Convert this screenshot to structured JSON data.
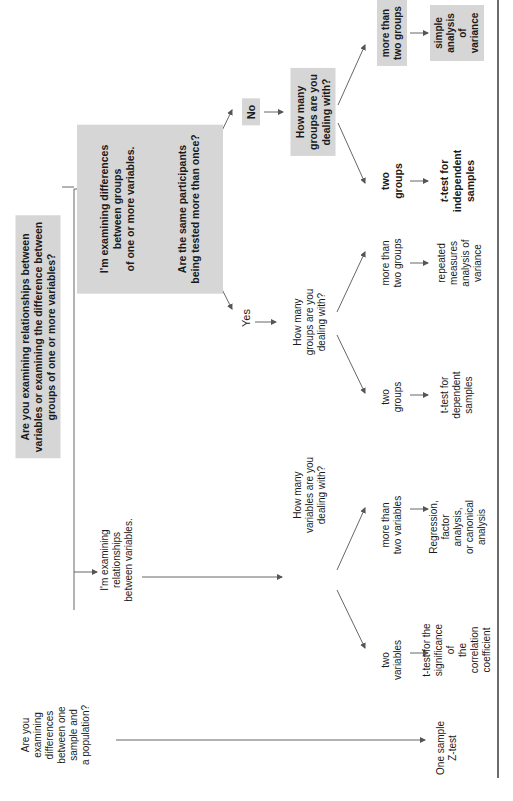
{
  "orientation": "rotated 90 degrees counter-clockwise",
  "colors": {
    "box_fill": "#d6d6d6",
    "line": "#555555",
    "text": "#1a1a1a"
  },
  "nodes": {
    "root": "Are you examining relationships between\nvariables or examining the difference between\ngroups of one or more variables?",
    "groups": "I'm examining differences\nbetween groups\nof one or more variables.",
    "same_participants": "Are the same participants\nbeing tested more than once?",
    "no": "No",
    "yes": "Yes",
    "no_how_many_groups": "How many\ngroups are you\ndealing with?",
    "no_more_than_two": "more than\ntwo groups",
    "no_simple_anova": "simple\nanalysis of\nvariance",
    "no_two_groups": "two\ngroups",
    "no_ttest_independent_prefix": "t",
    "no_ttest_independent": "-test for\nindependent\nsamples",
    "yes_how_many_groups": "How many\ngroups are you\ndealing with?",
    "yes_more_than_two": "more than\ntwo groups",
    "yes_repeated_anova": "repeated\nmeasures\nanalysis of\nvariance",
    "yes_two_groups": "two\ngroups",
    "yes_ttest_dependent": "t-test for\ndependent\nsamples",
    "relationships": "I'm examining\nrelationships\nbetween variables.",
    "how_many_variables": "How many\nvariables are you\ndealing with?",
    "more_than_two_variables": "more than\ntwo variables",
    "regression": "Regression,\nfactor analysis,\nor canonical\nanalysis",
    "two_variables": "two\nvariables",
    "ttest_correlation": "t-test for the\nsignificance of\nthe correlation\ncoefficient",
    "one_sample_question": "Are you\nexamining\ndifferences\nbetween one\nsample and\na population?",
    "one_sample_z": "One sample\nZ-test"
  }
}
